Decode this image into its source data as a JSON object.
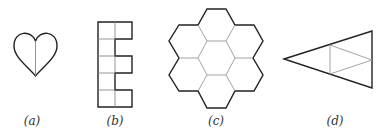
{
  "figures": [
    {
      "id": "a",
      "label": "(a)",
      "shape": "heart",
      "description": "heart divided by a vertical center line",
      "label_x": 32
    },
    {
      "id": "b",
      "label": "(b)",
      "shape": "E-shaped polyomino",
      "description": "E shape made of 8 unit squares (5x2 grid missing right cells in rows 2 and 4)",
      "label_x": 115
    },
    {
      "id": "c",
      "label": "(c)",
      "shape": "hexagon cluster",
      "description": "seven regular hexagons: one center surrounded by six",
      "label_x": 216
    },
    {
      "id": "d",
      "label": "(d)",
      "shape": "triangle",
      "description": "isosceles triangle pointing left, with inner lines forming a smaller inscribed triangle",
      "label_x": 335
    }
  ],
  "colors": {
    "outline": "#222222",
    "inner": "#888888",
    "background": "#ffffff"
  }
}
